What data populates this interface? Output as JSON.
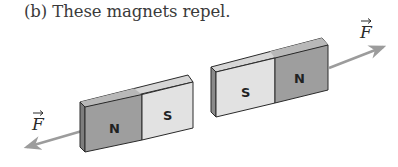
{
  "caption": "(b) These magnets repel.",
  "magnets": [
    {
      "name": "left-magnet",
      "poles": [
        "N",
        "S"
      ],
      "force_direction": "left"
    },
    {
      "name": "right-magnet",
      "poles": [
        "S",
        "N"
      ],
      "force_direction": "right"
    }
  ],
  "force_label": "F",
  "colors": {
    "north_face": "#9a9a9a",
    "south_face": "#dcdcdc",
    "top_face": "#c8c8c8",
    "arrow": "#9c9c9c",
    "outline": "#2a2a2a"
  }
}
